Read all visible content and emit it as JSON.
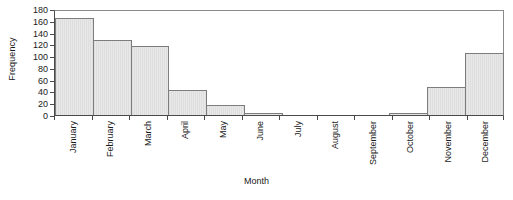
{
  "chart_data": {
    "type": "bar",
    "title": "",
    "xlabel": "Month",
    "ylabel": "Frequency",
    "categories": [
      "January",
      "February",
      "March",
      "April",
      "May",
      "June",
      "July",
      "August",
      "September",
      "October",
      "November",
      "December"
    ],
    "values": [
      165,
      127,
      118,
      43,
      17,
      3,
      0,
      0,
      0,
      4,
      48,
      105
    ],
    "ylim": [
      0,
      180
    ],
    "yticks": [
      0,
      20,
      40,
      60,
      80,
      100,
      120,
      140,
      160,
      180
    ],
    "ytick_labels": [
      "0",
      "20",
      "40",
      "60",
      "80",
      "100",
      "120",
      "140",
      "160",
      "180"
    ],
    "grid": false,
    "legend": null,
    "bar_fill_color": "#e2e2e2",
    "bar_border_color": "#7d7d7d",
    "axis_color": "#4a4a4a",
    "background_color": "#ffffff"
  }
}
